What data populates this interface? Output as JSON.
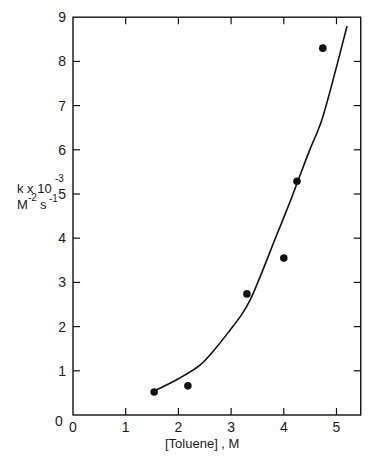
{
  "chart_data": {
    "type": "scatter",
    "title": "",
    "xlabel": "[Toluene] , M",
    "ylabel": "k x 10^-3 M^-2 s^-1",
    "ylabel_lines": {
      "line1_main": "k x 10",
      "line1_sup": "-3",
      "line2_main_m": "M",
      "line2_sup_m": "-2",
      "line2_main_s": "s",
      "line2_sup_s": "-1"
    },
    "xlim": [
      0,
      5.46
    ],
    "ylim": [
      0,
      9
    ],
    "x_ticks": [
      0,
      1,
      2,
      3,
      4,
      5
    ],
    "x_tick_labels": [
      "0",
      "1",
      "2",
      "3",
      "4",
      "5"
    ],
    "y_ticks": [
      0,
      1,
      2,
      3,
      4,
      5,
      6,
      7,
      8,
      9
    ],
    "y_tick_labels": [
      "0",
      "1",
      "2",
      "3",
      "4",
      "5",
      "6",
      "7",
      "8",
      "9"
    ],
    "grid": false,
    "legend": null,
    "series": [
      {
        "name": "measured",
        "kind": "scatter",
        "x": [
          1.54,
          2.18,
          3.3,
          4.0,
          4.25,
          4.74
        ],
        "y": [
          0.52,
          0.66,
          2.74,
          3.55,
          5.29,
          8.3
        ]
      },
      {
        "name": "fitted curve",
        "kind": "line",
        "x": [
          1.59,
          2.0,
          2.41,
          2.7,
          2.98,
          3.2,
          3.36,
          3.5,
          3.64,
          3.8,
          3.98,
          4.15,
          4.31,
          4.5,
          4.72,
          4.95,
          5.2
        ],
        "y": [
          0.57,
          0.82,
          1.13,
          1.5,
          1.92,
          2.27,
          2.6,
          2.98,
          3.39,
          3.88,
          4.41,
          4.92,
          5.43,
          6.02,
          6.67,
          7.65,
          8.8
        ]
      }
    ]
  },
  "colors": {
    "ink": "#111111",
    "background": "#ffffff"
  }
}
